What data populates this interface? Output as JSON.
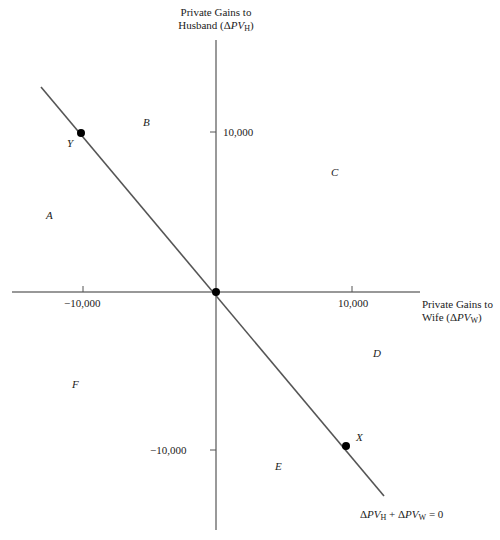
{
  "diagram": {
    "y_axis": {
      "label_line1": "Private Gains to",
      "label_line2_prefix": "Husband (",
      "label_delta": "Δ",
      "label_var": "PV",
      "label_sub": "H",
      "label_suffix": ")",
      "tick_pos": "10,000",
      "tick_neg": "−10,000"
    },
    "x_axis": {
      "label_line1": "Private Gains to",
      "label_line2_prefix": "Wife (",
      "label_delta": "Δ",
      "label_var": "PV",
      "label_sub": "W",
      "label_suffix": ")",
      "tick_pos": "10,000",
      "tick_neg": "−10,000"
    },
    "line_equation": {
      "d1": "Δ",
      "v1": "PV",
      "s1": "H",
      "plus": " + ",
      "d2": "Δ",
      "v2": "PV",
      "s2": "W",
      "rhs": " = 0"
    },
    "points": [
      {
        "label": "Y",
        "x": -10000,
        "y": 10000
      },
      {
        "label": "O",
        "x": 0,
        "y": 0
      },
      {
        "label": "X",
        "x": 10000,
        "y": -10000
      }
    ],
    "regions": {
      "A": "A",
      "B": "B",
      "C": "C",
      "D": "D",
      "E": "E",
      "F": "F"
    },
    "colors": {
      "axis": "#333333",
      "line": "#555555",
      "point": "#000000"
    }
  }
}
